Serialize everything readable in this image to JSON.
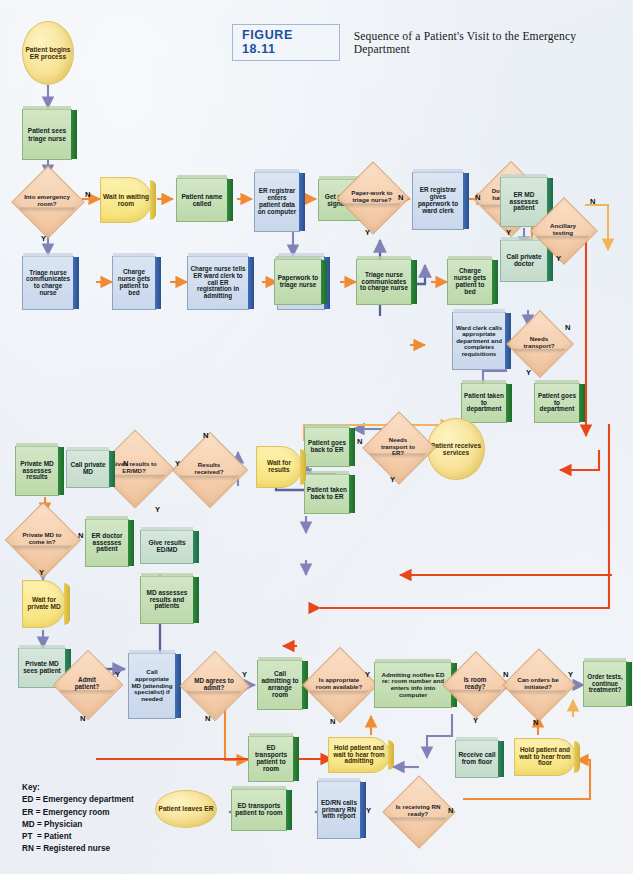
{
  "figure": {
    "badge": "FIGURE 18.11",
    "title": "Sequence of a Patient's Visit to the Emergency Department"
  },
  "colors": {
    "process_green": "#bcd9aa",
    "process_teal": "#c4dbcb",
    "process_blue": "#b9cae2",
    "decision_peach": "#f5cfae",
    "terminator_yellow": "#f7e08f",
    "arrow_orange": "#f08a33",
    "arrow_purple": "#8e8fc0",
    "arrow_red": "#e8471a",
    "badge_blue": "#1a4f9c"
  },
  "key": {
    "heading": "Key:",
    "lines": [
      "ED = Emergency department",
      "ER = Emergency room",
      "MD = Physician",
      "PT  = Patient",
      "RN = Registered nurse"
    ]
  },
  "nodes": {
    "n01": "Patient begins ER process",
    "n02": "Patient sees triage nurse",
    "n03": "Into emergency room?",
    "n04": "Wait in waiting room",
    "n05": "Patient name called",
    "n06": "ER registrar enters patient data on computer",
    "n07": "Get patient signature",
    "n08": "Paper-work to triage nurse?",
    "n09": "ER registrar gives paperwork to ward clerk",
    "n10": "Does patient have private MD?",
    "n11": "ER MD assesses patient",
    "n12": "Call private doctor",
    "n13": "Ancillary testing",
    "n14": "Triage nurse communicates to charge nurse",
    "n15": "Charge nurse gets patient to bed",
    "n16": "Charge nurse tells ER ward clerk to call ER registration in admitting",
    "n17": "ER Registrar comes to room to get info",
    "n18": "Paperwork to triage nurse",
    "n19": "Triage nurse communicates to charge nurse",
    "n20": "Charge nurse gets patient to bed",
    "n21": "Ward clerk calls appropriate department and completes requisitions",
    "n22": "Needs transport?",
    "n23": "Patient taken to department",
    "n24": "Patient goes to department",
    "n25": "Patient receives services",
    "n26": "Needs transport to ER?",
    "n27": "Patient goes back to ER",
    "n28": "Patient taken back to ER",
    "n29": "Wait for results",
    "n30": "Results received?",
    "n31": "Gives results to ER/MD?",
    "n32": "Call private MD",
    "n33": "Private MD assesses results",
    "n34": "Private MD to come in?",
    "n35": "ER doctor assesses patient",
    "n36": "Give results ED/MD",
    "n37": "MD assesses results and patients",
    "n38": "Wait for private MD",
    "n39": "Private MD sees patient",
    "n40": "Admit patient?",
    "n41": "Call appropriate MD (attending specialist) if needed",
    "n42": "MD agrees to admit?",
    "n43": "Call admitting to arrange room",
    "n44": "Is appropriate room available?",
    "n45": "Admitting notifies ED re: room number and enters info into computer",
    "n46": "Is room ready?",
    "n47": "Can orders be initiated?",
    "n48": "Order tests, continue treatment?",
    "n49": "ED transports patient to room",
    "n50": "Hold patient and wait to hear from admitting",
    "n51": "Receive call from floor",
    "n52": "Hold patient and wait to hear from floor",
    "n53": "Patient leaves ER",
    "n54": "ED transports patient to room",
    "n55": "ED/RN calls primary RN with report",
    "n56": "Is receiving RN ready?"
  },
  "edge_labels": {
    "e01": "N",
    "e02": "Y",
    "e03": "N",
    "e04": "Y",
    "e05": "N",
    "e06": "Y",
    "e07": "N",
    "e08": "Y",
    "e09": "N",
    "e10": "Y",
    "e11": "N",
    "e12": "Y",
    "e13": "N",
    "e14": "Y",
    "e15": "N",
    "e16": "Y",
    "e17": "N",
    "e18": "Y",
    "e19": "N",
    "e20": "Y",
    "e21": "N",
    "e22": "Y",
    "e23": "N",
    "e24": "Y",
    "e25": "N",
    "e26": "Y",
    "e27": "N",
    "e28": "Y",
    "e29": "N",
    "e30": "Y",
    "e31": "N",
    "e32": "Y"
  }
}
